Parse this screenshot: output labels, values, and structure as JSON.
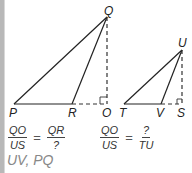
{
  "diagram": {
    "triangle_left": {
      "vertices": {
        "P": "P",
        "R": "R",
        "O": "O",
        "Q": "Q"
      }
    },
    "triangle_right": {
      "vertices": {
        "T": "T",
        "V": "V",
        "S": "S",
        "U": "U"
      }
    },
    "line_color": "#222222",
    "dashed_color": "#333333"
  },
  "equations": {
    "left": {
      "num1": "QO",
      "den1": "US",
      "eq": "=",
      "num2": "QR",
      "den2": "?"
    },
    "right": {
      "num1": "QO",
      "den1": "US",
      "eq": "=",
      "num2": "?",
      "den2": "TU"
    }
  },
  "answer": {
    "text": "UV, PQ",
    "color": "#888888"
  }
}
